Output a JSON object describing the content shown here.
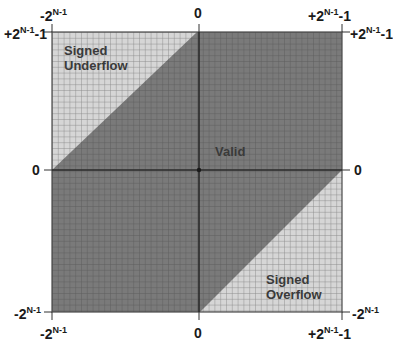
{
  "diagram": {
    "regions": {
      "underflow": "Signed Underflow",
      "underflow_line1": "Signed",
      "underflow_line2": "Underflow",
      "valid": "Valid",
      "overflow_line1": "Signed",
      "overflow_line2": "Overflow"
    },
    "axis_labels": {
      "top_left": {
        "base": "-2",
        "exp": "N-1",
        "suffix": ""
      },
      "top_center": {
        "base": "0",
        "exp": "",
        "suffix": ""
      },
      "top_right": {
        "base": "+2",
        "exp": "N-1",
        "suffix": "-1"
      },
      "left_top": {
        "base": "+2",
        "exp": "N-1",
        "suffix": "-1"
      },
      "left_center": {
        "base": "0",
        "exp": "",
        "suffix": ""
      },
      "left_bottom": {
        "base": "-2",
        "exp": "N-1",
        "suffix": ""
      },
      "right_top": {
        "base": "+2",
        "exp": "N-1",
        "suffix": "-1"
      },
      "right_center": {
        "base": "0",
        "exp": "",
        "suffix": ""
      },
      "right_bottom": {
        "base": "-2",
        "exp": "N-1",
        "suffix": ""
      },
      "bottom_left": {
        "base": "-2",
        "exp": "N-1",
        "suffix": ""
      },
      "bottom_center": {
        "base": "0",
        "exp": "",
        "suffix": ""
      },
      "bottom_right": {
        "base": "+2",
        "exp": "N-1",
        "suffix": "-1"
      }
    },
    "colors": {
      "valid_fill": "#7a7a7a",
      "overflow_fill": "#d4d4d4",
      "grid_line": "#5a5a5a",
      "axis": "#2a2a2a"
    }
  }
}
